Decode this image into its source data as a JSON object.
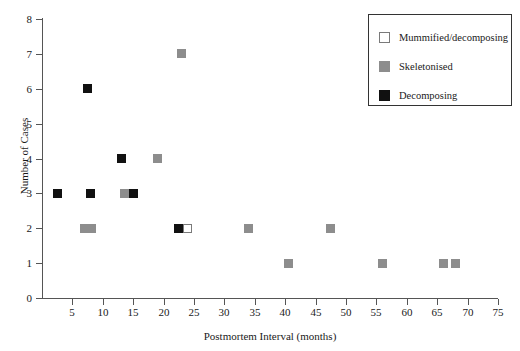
{
  "chart_data": {
    "type": "scatter",
    "title": "",
    "xlabel": "Postmortem Interval (months)",
    "ylabel": "Number of Cases",
    "xlim": [
      0,
      75
    ],
    "ylim": [
      0,
      8
    ],
    "xticks": [
      5,
      10,
      15,
      20,
      25,
      30,
      35,
      40,
      45,
      50,
      55,
      60,
      65,
      70,
      75
    ],
    "yticks": [
      0,
      1,
      2,
      3,
      4,
      5,
      6,
      7,
      8
    ],
    "grid": false,
    "legend_position": "top-right",
    "colors": {
      "mummified": "#ffffff",
      "skeletonised": "#8d8d8d",
      "decomposing": "#111111",
      "axis": "#555555",
      "text": "#1a1a1a"
    },
    "series": [
      {
        "name": "Mummified/decomposing",
        "color": "#ffffff",
        "points": [
          {
            "x": 24,
            "y": 2
          }
        ]
      },
      {
        "name": "Skeletonised",
        "color": "#8d8d8d",
        "points": [
          {
            "x": 23,
            "y": 7
          },
          {
            "x": 19,
            "y": 4
          },
          {
            "x": 13.5,
            "y": 3
          },
          {
            "x": 7,
            "y": 2
          },
          {
            "x": 8.2,
            "y": 2
          },
          {
            "x": 34,
            "y": 2
          },
          {
            "x": 47.5,
            "y": 2
          },
          {
            "x": 40.5,
            "y": 1
          },
          {
            "x": 56,
            "y": 1
          },
          {
            "x": 66,
            "y": 1
          },
          {
            "x": 68,
            "y": 1
          }
        ]
      },
      {
        "name": "Decomposing",
        "color": "#111111",
        "points": [
          {
            "x": 7.5,
            "y": 6
          },
          {
            "x": 13,
            "y": 4
          },
          {
            "x": 2.5,
            "y": 3
          },
          {
            "x": 8,
            "y": 3
          },
          {
            "x": 15,
            "y": 3
          },
          {
            "x": 22.5,
            "y": 2
          }
        ]
      }
    ]
  },
  "legend": {
    "items": [
      {
        "label": "Mummified/decomposing",
        "swatch": "mummified"
      },
      {
        "label": "Skeletonised",
        "swatch": "skeletonised"
      },
      {
        "label": "Decomposing",
        "swatch": "decomposing"
      }
    ]
  }
}
